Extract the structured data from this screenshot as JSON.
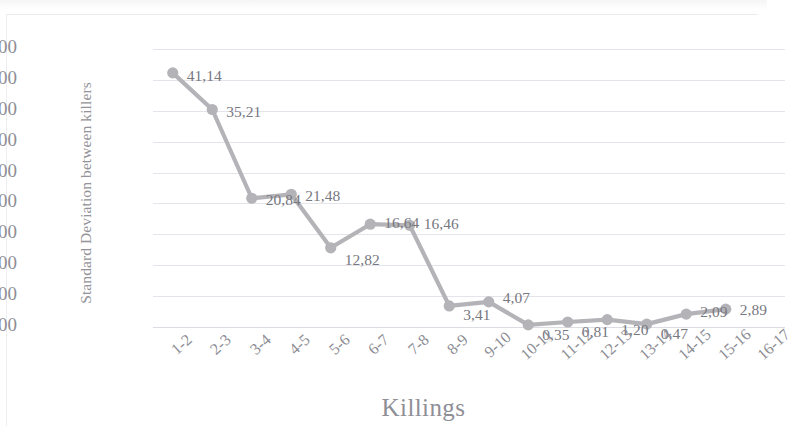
{
  "chart_data": {
    "type": "line",
    "title": "",
    "xlabel": "Killings",
    "ylabel": "Standard Deviation between killers",
    "categories": [
      "1-2",
      "2-3",
      "3-4",
      "4-5",
      "5-6",
      "6-7",
      "7-8",
      "8-9",
      "9-10",
      "10-11",
      "11-12",
      "12-13",
      "13-14",
      "14-15",
      "15-16",
      "16-17"
    ],
    "values": [
      41.14,
      35.21,
      20.84,
      21.48,
      12.82,
      16.64,
      16.46,
      3.41,
      4.07,
      0.35,
      0.81,
      1.2,
      0.47,
      2.09,
      2.89,
      null
    ],
    "data_labels": [
      "41,14",
      "35,21",
      "20,84",
      "21,48",
      "12,82",
      "16,64",
      "16,46",
      "3,41",
      "4,07",
      "0,35",
      "0,81",
      "1,20",
      "0,47",
      "2,09",
      "2,89"
    ],
    "ylim": [
      0,
      45
    ],
    "ytick_labels": [
      "0,00",
      "5,00",
      "10,00",
      "15,00",
      "20,00",
      "25,00",
      "30,00",
      "35,00",
      "40,00",
      "45,00"
    ],
    "ytick_values": [
      0,
      5,
      10,
      15,
      20,
      25,
      30,
      35,
      40,
      45
    ],
    "grid": "horizontal",
    "legend": "none",
    "series_color": "#b4b4b8",
    "marker": "circle",
    "decimal_separator": ","
  }
}
